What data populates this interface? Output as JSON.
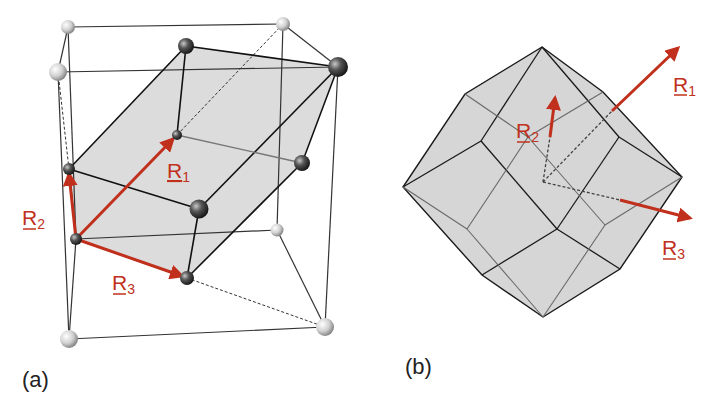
{
  "figure": {
    "panels": [
      {
        "id": "a",
        "label": "(a)",
        "description": "Cubic lattice cell with primitive rhombohedral cell (shaded) spanned by vectors",
        "vectors": [
          {
            "name": "R",
            "subscript": "1"
          },
          {
            "name": "R",
            "subscript": "2"
          },
          {
            "name": "R",
            "subscript": "3"
          }
        ]
      },
      {
        "id": "b",
        "label": "(b)",
        "description": "Wigner-Seitz cell (rhombic dodecahedron) with lattice vectors",
        "vectors": [
          {
            "name": "R",
            "subscript": "1"
          },
          {
            "name": "R",
            "subscript": "2"
          },
          {
            "name": "R",
            "subscript": "3"
          }
        ]
      }
    ],
    "colors": {
      "vector": "#c0301c",
      "shade": "#d9d9d9",
      "edge": "#1a1a1a"
    }
  }
}
